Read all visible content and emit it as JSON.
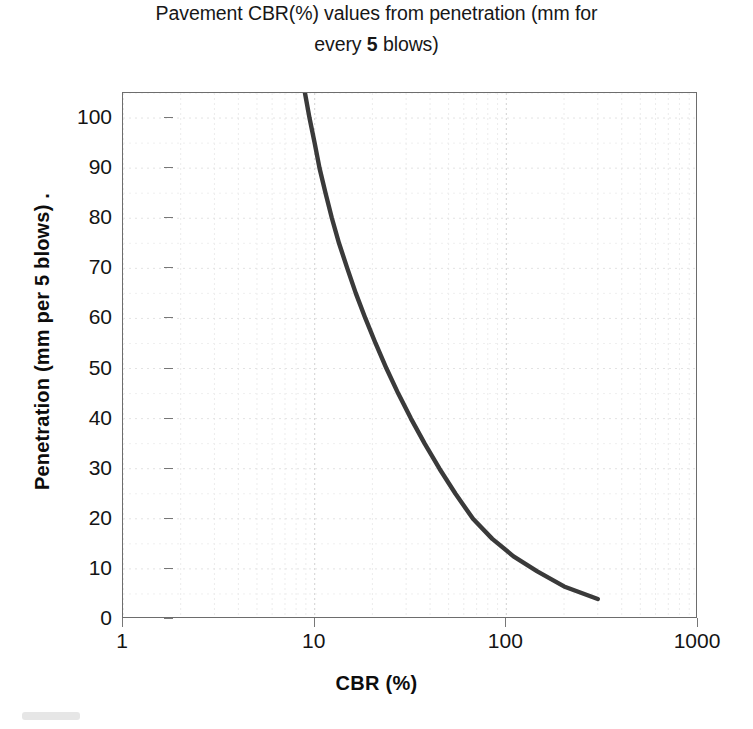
{
  "title": {
    "clipped_top_line": "Figure: Relationship between DCP",
    "line1_pre": "Pavement CBR(%) values from penetration (mm for",
    "line2_pre": "every ",
    "line2_bold": "5",
    "line2_post": " blows)"
  },
  "axes": {
    "y_label": "Penetration (mm per 5 blows)  .",
    "x_label": "CBR (%)",
    "y_ticks": [
      0,
      10,
      20,
      30,
      40,
      50,
      60,
      70,
      80,
      90,
      100
    ],
    "x_ticks": [
      "1",
      "10",
      "100",
      "1000"
    ]
  },
  "colors": {
    "curve": "#3a3a3a",
    "frame": "#6d6d6d",
    "gridline": "#e8e8e8",
    "background": "#ffffff",
    "text": "#141414"
  },
  "chart_data": {
    "type": "line",
    "title": "Pavement CBR(%) values from penetration (mm for every 5 blows)",
    "xlabel": "CBR (%)",
    "ylabel": "Penetration (mm per 5 blows)",
    "xscale": "log",
    "yscale": "linear",
    "xlim": [
      1,
      1000
    ],
    "ylim": [
      0,
      105
    ],
    "grid": true,
    "legend": "none",
    "series": [
      {
        "name": "DCP penetration vs CBR",
        "x": [
          8.9,
          9.4,
          10.0,
          10.6,
          11.4,
          12.3,
          13.4,
          14.8,
          16.4,
          18.4,
          20.8,
          23.7,
          27.3,
          31.8,
          37.5,
          44.8,
          54.3,
          67.0,
          84.5,
          109.0,
          145.0,
          200.0,
          300.0
        ],
        "y": [
          105,
          100,
          95,
          90,
          85,
          80,
          75,
          70,
          65,
          60,
          55,
          50,
          45,
          40,
          35,
          30,
          25,
          20,
          16,
          12.5,
          9.5,
          6.5,
          4.0
        ],
        "x_name": "CBR (%)",
        "y_name": "Penetration (mm per 5 blows)"
      }
    ],
    "annotations": []
  }
}
